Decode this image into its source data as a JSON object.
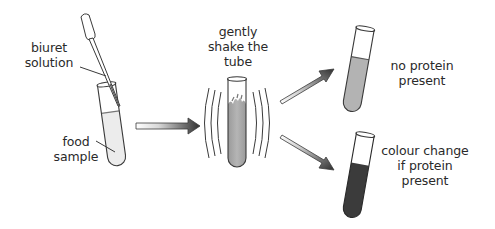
{
  "diagram": {
    "labels": {
      "biuret": [
        "biuret",
        "solution"
      ],
      "food": [
        "food",
        "sample"
      ],
      "shake": [
        "gently",
        "shake the",
        "tube"
      ],
      "no_protein": [
        "no protein",
        "present"
      ],
      "colour_change": [
        "colour change",
        "if protein",
        "present"
      ]
    },
    "steps": [
      {
        "id": "step-1",
        "description": "add biuret solution to food sample in test tube"
      },
      {
        "id": "step-2",
        "description": "gently shake the tube"
      },
      {
        "id": "result-negative",
        "description": "no protein present"
      },
      {
        "id": "result-positive",
        "description": "colour change if protein present"
      }
    ],
    "colors": {
      "outline": "#3a3a3a",
      "food_sample_liquid": "#ececec",
      "shaken_liquid": "#a9a9a9",
      "no_protein_liquid": "#b3b3b3",
      "protein_liquid": "#3b3b3b",
      "arrow_dark": "#2f2f2f",
      "arrow_light": "#ffffff"
    }
  }
}
